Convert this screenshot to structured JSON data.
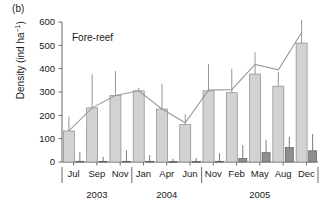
{
  "panel": {
    "label": "(b)"
  },
  "annotation": {
    "text": "Fore-reef"
  },
  "axes": {
    "ylabel_text": "Density (ind ha",
    "ylabel_sup": "−1",
    "ylabel_close": ")",
    "yticks": [
      0,
      100,
      200,
      300,
      400,
      500,
      600
    ],
    "ylim": [
      0,
      600
    ],
    "grid": false
  },
  "chart_data": {
    "type": "bar",
    "title": "Fore-reef",
    "xlabel": "",
    "ylabel": "Density (ind ha⁻¹)",
    "ylim": [
      0,
      600
    ],
    "grid": false,
    "legend_position": "none",
    "categories": [
      "Jul",
      "Sep",
      "Nov",
      "Jan",
      "Apr",
      "Jun",
      "Nov",
      "Feb",
      "May",
      "Aug",
      "Dec"
    ],
    "year_groups": [
      {
        "label": "2003",
        "start_index": 0,
        "end_index": 2
      },
      {
        "label": "2004",
        "start_index": 3,
        "end_index": 5
      },
      {
        "label": "2005",
        "start_index": 6,
        "end_index": 10
      }
    ],
    "series": [
      {
        "name": "light-bars",
        "color": "#d2d2d2",
        "values": [
          133,
          232,
          285,
          305,
          227,
          160,
          305,
          297,
          377,
          325,
          510
        ],
        "errors_upper": [
          195,
          375,
          390,
          318,
          335,
          205,
          420,
          400,
          470,
          385,
          610
        ]
      },
      {
        "name": "dark-bars",
        "color": "#8e8e8e",
        "values": [
          3,
          3,
          3,
          3,
          2,
          2,
          3,
          15,
          40,
          62,
          48
        ],
        "errors_upper": [
          42,
          22,
          50,
          30,
          14,
          18,
          38,
          72,
          95,
          108,
          120
        ]
      },
      {
        "name": "trend-line",
        "color": "#9a9a9a",
        "values": [
          133,
          232,
          285,
          305,
          227,
          168,
          308,
          310,
          418,
          395,
          555
        ]
      }
    ]
  }
}
